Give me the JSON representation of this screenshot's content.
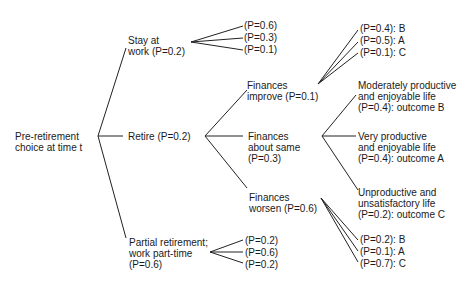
{
  "diagram": {
    "type": "decision-tree",
    "root": {
      "label": "Pre-retirement\nchoice at time t"
    },
    "choices": [
      {
        "id": "stay",
        "label": "Stay at\nwork (P=0.2)",
        "outcomes": [
          "(P=0.6)",
          "(P=0.3)",
          "(P=0.1)"
        ]
      },
      {
        "id": "retire",
        "label": "Retire (P=0.2)",
        "finances": [
          {
            "id": "improve",
            "label": "Finances\nimprove (P=0.1)",
            "outcomes": [
              "(P=0.4): B",
              "(P=0.5): A",
              "(P=0.1): C"
            ]
          },
          {
            "id": "same",
            "label": "Finances\nabout same\n(P=0.3)",
            "outcomes": [
              "Moderately productive\nand enjoyable life\n(P=0.4): outcome B",
              "Very productive\nand enjoyable life\n(P=0.4): outcome A",
              "Unproductive and\nunsatisfactory life\n(P=0.2): outcome C"
            ]
          },
          {
            "id": "worsen",
            "label": "Finances\nworsen (P=0.6)",
            "outcomes": [
              "(P=0.2): B",
              "(P=0.1): A",
              "(P=0.7): C"
            ]
          }
        ]
      },
      {
        "id": "partial",
        "label": "Partial retirement;\nwork part-time\n(P=0.6)",
        "outcomes": [
          "(P=0.2)",
          "(P=0.6)",
          "(P=0.2)"
        ]
      }
    ]
  }
}
